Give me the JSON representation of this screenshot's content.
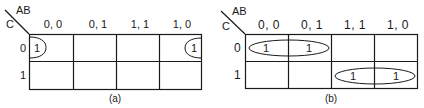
{
  "maps": [
    {
      "id": "a",
      "caption": "(a)",
      "col_var_label": "AB",
      "row_var_label": "C",
      "columns": [
        "0, 0",
        "0, 1",
        "1, 1",
        "1, 0"
      ],
      "rows": [
        "0",
        "1"
      ],
      "cells": [
        [
          "1",
          "",
          "",
          "1"
        ],
        [
          "",
          "",
          "",
          ""
        ]
      ],
      "groups": [
        {
          "description": "wrap-around pair C=0, AB=00 and AB=10",
          "cells": [
            [
              0,
              0
            ],
            [
              0,
              3
            ]
          ]
        }
      ]
    },
    {
      "id": "b",
      "caption": "(b)",
      "col_var_label": "AB",
      "row_var_label": "C",
      "columns": [
        "0, 0",
        "0, 1",
        "1, 1",
        "1, 0"
      ],
      "rows": [
        "0",
        "1"
      ],
      "cells": [
        [
          "1",
          "1",
          "",
          ""
        ],
        [
          "",
          "",
          "1",
          "1"
        ]
      ],
      "groups": [
        {
          "description": "pair C=0, AB=00 and AB=01",
          "cells": [
            [
              0,
              0
            ],
            [
              0,
              1
            ]
          ]
        },
        {
          "description": "pair C=1, AB=11 and AB=10",
          "cells": [
            [
              1,
              2
            ],
            [
              1,
              3
            ]
          ]
        }
      ]
    }
  ],
  "colors": {
    "line": "#1a1a1a",
    "background": "#ffffff"
  }
}
